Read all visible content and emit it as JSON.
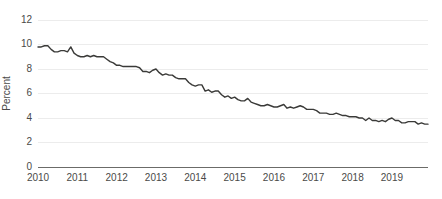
{
  "chart_data": {
    "type": "line",
    "title": "",
    "subtitle": "",
    "xlabel": "",
    "ylabel": "Percent",
    "ylim": [
      0,
      12
    ],
    "yticks": [
      0,
      2,
      4,
      6,
      8,
      10,
      12
    ],
    "ytick_labels": [
      "0",
      "2",
      "4",
      "6",
      "8",
      "10",
      "12"
    ],
    "xlim": [
      "2010-01",
      "2019-12"
    ],
    "xticks": [
      "2010",
      "2011",
      "2012",
      "2013",
      "2014",
      "2015",
      "2016",
      "2017",
      "2018",
      "2019"
    ],
    "xtick_labels": [
      "2010",
      "2011",
      "2012",
      "2013",
      "2014",
      "2015",
      "2016",
      "2017",
      "2018",
      "2019"
    ],
    "grid": true,
    "grid_axis": "y",
    "legend": false,
    "legend_position": "none",
    "line_color": "#3a3a38",
    "grid_color": "#ececec",
    "axis_color": "#6b6b68",
    "label_color": "#4a4a48",
    "background_color": "#ffffff",
    "series": [
      {
        "name": "Unemployment rate",
        "x": [
          "2010-01",
          "2010-02",
          "2010-03",
          "2010-04",
          "2010-05",
          "2010-06",
          "2010-07",
          "2010-08",
          "2010-09",
          "2010-10",
          "2010-11",
          "2010-12",
          "2011-01",
          "2011-02",
          "2011-03",
          "2011-04",
          "2011-05",
          "2011-06",
          "2011-07",
          "2011-08",
          "2011-09",
          "2011-10",
          "2011-11",
          "2011-12",
          "2012-01",
          "2012-02",
          "2012-03",
          "2012-04",
          "2012-05",
          "2012-06",
          "2012-07",
          "2012-08",
          "2012-09",
          "2012-10",
          "2012-11",
          "2012-12",
          "2013-01",
          "2013-02",
          "2013-03",
          "2013-04",
          "2013-05",
          "2013-06",
          "2013-07",
          "2013-08",
          "2013-09",
          "2013-10",
          "2013-11",
          "2013-12",
          "2014-01",
          "2014-02",
          "2014-03",
          "2014-04",
          "2014-05",
          "2014-06",
          "2014-07",
          "2014-08",
          "2014-09",
          "2014-10",
          "2014-11",
          "2014-12",
          "2015-01",
          "2015-02",
          "2015-03",
          "2015-04",
          "2015-05",
          "2015-06",
          "2015-07",
          "2015-08",
          "2015-09",
          "2015-10",
          "2015-11",
          "2015-12",
          "2016-01",
          "2016-02",
          "2016-03",
          "2016-04",
          "2016-05",
          "2016-06",
          "2016-07",
          "2016-08",
          "2016-09",
          "2016-10",
          "2016-11",
          "2016-12",
          "2017-01",
          "2017-02",
          "2017-03",
          "2017-04",
          "2017-05",
          "2017-06",
          "2017-07",
          "2017-08",
          "2017-09",
          "2017-10",
          "2017-11",
          "2017-12",
          "2018-01",
          "2018-02",
          "2018-03",
          "2018-04",
          "2018-05",
          "2018-06",
          "2018-07",
          "2018-08",
          "2018-09",
          "2018-10",
          "2018-11",
          "2018-12",
          "2019-01",
          "2019-02",
          "2019-03",
          "2019-04",
          "2019-05",
          "2019-06",
          "2019-07",
          "2019-08",
          "2019-09",
          "2019-10",
          "2019-11",
          "2019-12"
        ],
        "values": [
          9.8,
          9.8,
          9.9,
          9.9,
          9.6,
          9.4,
          9.4,
          9.5,
          9.5,
          9.4,
          9.8,
          9.3,
          9.1,
          9.0,
          9.0,
          9.1,
          9.0,
          9.1,
          9.0,
          9.0,
          9.0,
          8.8,
          8.6,
          8.5,
          8.3,
          8.3,
          8.2,
          8.2,
          8.2,
          8.2,
          8.2,
          8.1,
          7.8,
          7.8,
          7.7,
          7.9,
          8.0,
          7.7,
          7.5,
          7.6,
          7.5,
          7.5,
          7.3,
          7.2,
          7.2,
          7.2,
          6.9,
          6.7,
          6.6,
          6.7,
          6.7,
          6.2,
          6.3,
          6.1,
          6.2,
          6.2,
          5.9,
          5.7,
          5.8,
          5.6,
          5.7,
          5.5,
          5.4,
          5.4,
          5.6,
          5.3,
          5.2,
          5.1,
          5.0,
          5.0,
          5.1,
          5.0,
          4.9,
          4.9,
          5.0,
          5.1,
          4.8,
          4.9,
          4.8,
          4.9,
          5.0,
          4.9,
          4.7,
          4.7,
          4.7,
          4.6,
          4.4,
          4.4,
          4.4,
          4.3,
          4.3,
          4.4,
          4.3,
          4.2,
          4.2,
          4.1,
          4.1,
          4.1,
          4.0,
          4.0,
          3.8,
          4.0,
          3.8,
          3.8,
          3.7,
          3.8,
          3.7,
          3.9,
          4.0,
          3.8,
          3.8,
          3.6,
          3.6,
          3.7,
          3.7,
          3.7,
          3.5,
          3.6,
          3.5,
          3.5
        ]
      }
    ]
  }
}
